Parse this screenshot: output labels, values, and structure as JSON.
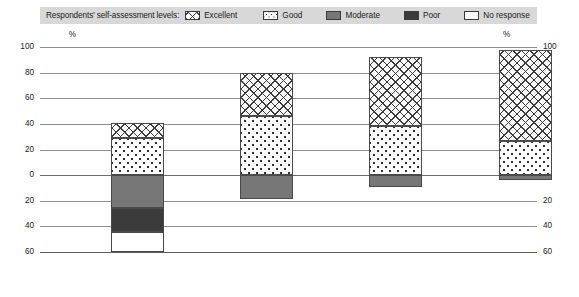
{
  "legend": {
    "title": "Respondents' self-assessment levels:",
    "items": [
      {
        "label": "Excellent",
        "pattern": "diagonal-cross-hatch",
        "color": "#fbfbfb"
      },
      {
        "label": "Good",
        "pattern": "dots",
        "color": "#fcfcfc"
      },
      {
        "label": "Moderate",
        "pattern": "solid",
        "color": "#777777"
      },
      {
        "label": "Poor",
        "pattern": "solid",
        "color": "#3b3b3b"
      },
      {
        "label": "No response",
        "pattern": "solid",
        "color": "#ffffff"
      }
    ]
  },
  "axis": {
    "unit_left": "%",
    "unit_right": "%",
    "ticks": [
      "100",
      "80",
      "60",
      "40",
      "20",
      "0",
      "20",
      "40",
      "60"
    ],
    "xlabel": "Prose literacy levels"
  },
  "chart_data": {
    "type": "bar",
    "title": "",
    "subtitle": "",
    "xlabel": "Prose literacy levels",
    "ylabel": "%",
    "ylim": [
      -60,
      100
    ],
    "grid": true,
    "legend_position": "top",
    "stacked": true,
    "diverging": true,
    "categories": [
      "Level 1",
      "Level 2",
      "Level 3",
      "Level 4/5"
    ],
    "tick_labels": [
      "100",
      "80",
      "60",
      "40",
      "20",
      "0",
      "20",
      "40",
      "60"
    ],
    "tick_values": [
      100,
      80,
      60,
      40,
      20,
      0,
      -20,
      -40,
      -60
    ],
    "series": [
      {
        "name": "Excellent",
        "direction": "up",
        "values": [
          12,
          34,
          54,
          71
        ]
      },
      {
        "name": "Good",
        "direction": "up",
        "values": [
          29,
          46,
          38,
          27
        ]
      },
      {
        "name": "Moderate",
        "direction": "down",
        "values": [
          26,
          19,
          9,
          4
        ]
      },
      {
        "name": "Poor",
        "direction": "down",
        "values": [
          18,
          0,
          0,
          0
        ]
      },
      {
        "name": "No response",
        "direction": "down",
        "values": [
          16,
          0,
          0,
          0
        ]
      }
    ],
    "positive_totals": [
      41,
      80,
      92,
      98
    ],
    "negative_totals": [
      60,
      19,
      9,
      4
    ]
  }
}
